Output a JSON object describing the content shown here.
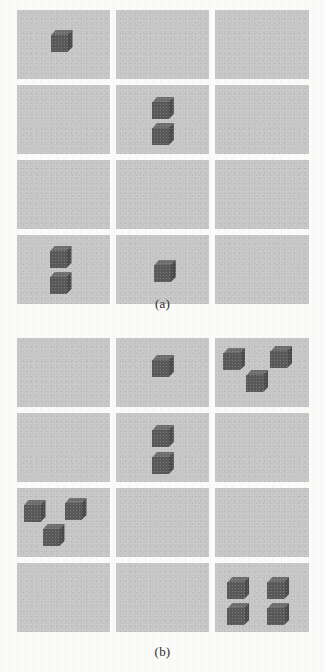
{
  "figure": {
    "kind": "stimulus-grids",
    "colors": {
      "cell_background": "#c6c6c6",
      "cube_front": "#585858",
      "cube_top": "#6d6d6d",
      "cube_side": "#4a4a4a",
      "page_background": "#fbfbfa"
    },
    "panels": [
      {
        "id": "a",
        "caption": "(a)",
        "columns": 3,
        "rows": 4,
        "cells": [
          {
            "row": 1,
            "col": 1,
            "cube_count": 1,
            "cubes": [
              {
                "x": 34,
                "y": 20
              }
            ]
          },
          {
            "row": 1,
            "col": 2,
            "cube_count": 0,
            "cubes": []
          },
          {
            "row": 1,
            "col": 3,
            "cube_count": 0,
            "cubes": []
          },
          {
            "row": 2,
            "col": 1,
            "cube_count": 0,
            "cubes": []
          },
          {
            "row": 2,
            "col": 2,
            "cube_count": 2,
            "cubes": [
              {
                "x": 36,
                "y": 12
              },
              {
                "x": 36,
                "y": 38
              }
            ]
          },
          {
            "row": 2,
            "col": 3,
            "cube_count": 0,
            "cubes": []
          },
          {
            "row": 3,
            "col": 1,
            "cube_count": 0,
            "cubes": []
          },
          {
            "row": 3,
            "col": 2,
            "cube_count": 0,
            "cubes": []
          },
          {
            "row": 3,
            "col": 3,
            "cube_count": 0,
            "cubes": []
          },
          {
            "row": 4,
            "col": 1,
            "cube_count": 2,
            "cubes": [
              {
                "x": 33,
                "y": 11
              },
              {
                "x": 33,
                "y": 37
              }
            ]
          },
          {
            "row": 4,
            "col": 2,
            "cube_count": 1,
            "cubes": [
              {
                "x": 38,
                "y": 25
              }
            ]
          },
          {
            "row": 4,
            "col": 3,
            "cube_count": 0,
            "cubes": []
          }
        ]
      },
      {
        "id": "b",
        "caption": "(b)",
        "columns": 3,
        "rows": 4,
        "cells": [
          {
            "row": 1,
            "col": 1,
            "cube_count": 0,
            "cubes": []
          },
          {
            "row": 1,
            "col": 2,
            "cube_count": 1,
            "cubes": [
              {
                "x": 36,
                "y": 17
              }
            ]
          },
          {
            "row": 1,
            "col": 3,
            "cube_count": 3,
            "cubes": [
              {
                "x": 8,
                "y": 10
              },
              {
                "x": 55,
                "y": 8
              },
              {
                "x": 31,
                "y": 32
              }
            ]
          },
          {
            "row": 2,
            "col": 1,
            "cube_count": 0,
            "cubes": []
          },
          {
            "row": 2,
            "col": 2,
            "cube_count": 2,
            "cubes": [
              {
                "x": 36,
                "y": 12
              },
              {
                "x": 36,
                "y": 39
              }
            ]
          },
          {
            "row": 2,
            "col": 3,
            "cube_count": 0,
            "cubes": []
          },
          {
            "row": 3,
            "col": 1,
            "cube_count": 3,
            "cubes": [
              {
                "x": 7,
                "y": 12
              },
              {
                "x": 48,
                "y": 10
              },
              {
                "x": 26,
                "y": 36
              }
            ]
          },
          {
            "row": 3,
            "col": 2,
            "cube_count": 0,
            "cubes": []
          },
          {
            "row": 3,
            "col": 3,
            "cube_count": 0,
            "cubes": []
          },
          {
            "row": 4,
            "col": 1,
            "cube_count": 0,
            "cubes": []
          },
          {
            "row": 4,
            "col": 2,
            "cube_count": 0,
            "cubes": []
          },
          {
            "row": 4,
            "col": 3,
            "cube_count": 4,
            "cubes": [
              {
                "x": 12,
                "y": 14
              },
              {
                "x": 52,
                "y": 14
              },
              {
                "x": 12,
                "y": 40
              },
              {
                "x": 52,
                "y": 40
              }
            ]
          }
        ]
      }
    ]
  }
}
